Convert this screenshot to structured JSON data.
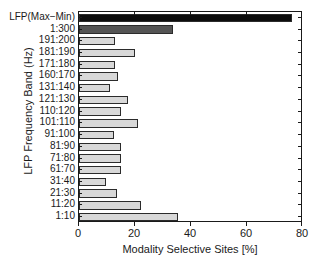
{
  "chart_data": {
    "type": "bar",
    "orientation": "horizontal",
    "title": "",
    "xlabel": "Modality Selective Sites [%]",
    "ylabel": "LFP Frequency Band (Hz)",
    "xlim": [
      0,
      80
    ],
    "xticks": [
      0,
      20,
      40,
      60,
      80
    ],
    "xticklabels": [
      "0",
      "20",
      "40",
      "60",
      "80"
    ],
    "grid": false,
    "legend": null,
    "categories": [
      "LFP(Max−Min)",
      "1:300",
      "191:200",
      "181:190",
      "171:180",
      "160:170",
      "131:140",
      "121:130",
      "110:120",
      "101:110",
      "91:100",
      "81:90",
      "71:80",
      "61:70",
      "31:40",
      "21:30",
      "11:20",
      "1:10"
    ],
    "values": [
      76.0,
      33.6,
      12.8,
      20.0,
      12.8,
      13.9,
      11.0,
      17.5,
      15.0,
      21.0,
      12.5,
      15.0,
      15.0,
      15.0,
      9.8,
      13.7,
      22.0,
      35.4
    ],
    "bar_colors": [
      "#0d0d0d",
      "#545454",
      "#d8d8d8",
      "#d8d8d8",
      "#d8d8d8",
      "#d8d8d8",
      "#d8d8d8",
      "#d8d8d8",
      "#d8d8d8",
      "#d8d8d8",
      "#d8d8d8",
      "#d8d8d8",
      "#d8d8d8",
      "#d8d8d8",
      "#d8d8d8",
      "#d8d8d8",
      "#d8d8d8",
      "#d8d8d8"
    ],
    "bar_edge_color": "#2b2b2b",
    "axis_color": "#1a1a1a",
    "background": "#ffffff"
  }
}
